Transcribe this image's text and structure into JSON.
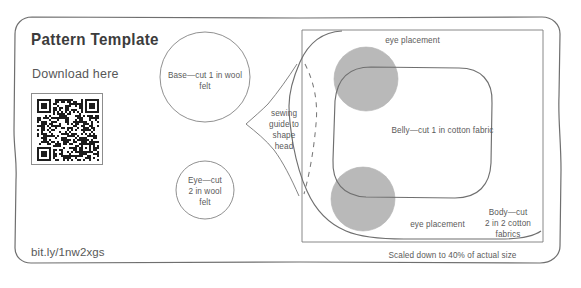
{
  "page": {
    "width": 581,
    "height": 288,
    "background": "#ffffff",
    "ink_color": "#6b6b6b",
    "text_color": "#5a5a5a",
    "shade_color": "#b8b8b8"
  },
  "header": {
    "title": "Pattern Template",
    "download_prompt": "Download here",
    "short_url": "bit.ly/1nw2xgs"
  },
  "qr": {
    "name": "qr-code",
    "alt": "QR code linking to downloadable pattern template"
  },
  "pieces": {
    "base": {
      "label": "Base—cut 1 in wool\nfelt",
      "shape": "circle"
    },
    "eye": {
      "label": "Eye—cut\n2 in wool\nfelt",
      "shape": "circle"
    },
    "sewing_guide": {
      "label": "sewing\nguide to\nshape\nhead",
      "shape": "dashed-guide"
    },
    "belly": {
      "label": "Belly—cut 1 in cotton fabric",
      "shape": "rounded-blob"
    },
    "body": {
      "label": "Body—cut\n2 in 2 cotton\nfabrics",
      "shape": "rounded-rect-outline"
    },
    "eye_placement_top": {
      "label": "eye placement"
    },
    "eye_placement_bottom": {
      "label": "eye placement"
    }
  },
  "footer": {
    "scale_note": "Scaled down to 40% of actual size"
  }
}
